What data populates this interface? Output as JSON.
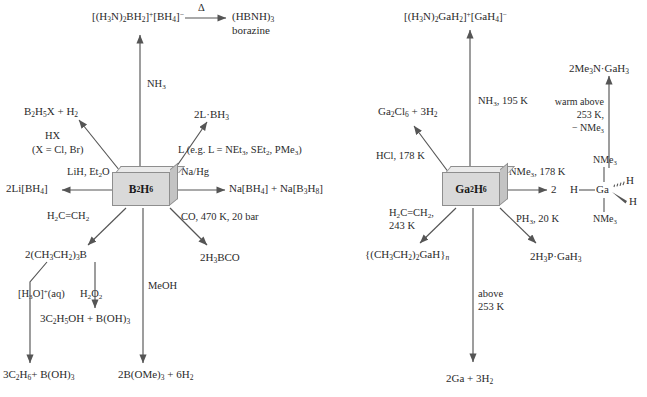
{
  "diagram": {
    "left_scheme": {
      "center": "B2H6",
      "center_html": "B<sub>2</sub>H<sub>6</sub>",
      "products": {
        "ammonia_adduct": "[(H3N)2BH2]+[BH4]-",
        "borazine": "(HBNH)3",
        "borazine_name": "borazine",
        "halodiborane": "B2H5X + H2",
        "lewis_adduct": "2L·BH3",
        "lithium_borohydride": "2Li[BH4]",
        "sodium_salts": "Na[BH4] + Na[B3H8]",
        "triethylborane": "2(CH3CH2)3B",
        "borane_carbonyl": "2H3BCO",
        "ethanol_boric": "3C2H5OH + B(OH)3",
        "ethane_boric": "3C2H6 + B(OH)3",
        "trimethylborate": "2B(OMe)3 + 6H2"
      },
      "conditions": {
        "ammonia": "NH3",
        "heat": "Δ",
        "hydrogen_halide": "HX",
        "halide_note": "(X = Cl, Br)",
        "lewis_base": "L (e.g. L = NEt3, SEt2, PMe3)",
        "lithium_hydride": "LiH, Et2O",
        "sodium_amalgam": "Na/Hg",
        "ethene": "H2C=CH2",
        "carbon_monoxide": "CO, 470 K, 20 bar",
        "methanol": "MeOH",
        "hydronium": "[H3O]+(aq)",
        "hydrogen_peroxide": "H2O2"
      }
    },
    "right_scheme": {
      "center": "Ga2H6",
      "center_html": "Ga<sub>2</sub>H<sub>6</sub>",
      "products": {
        "ammonia_adduct": "[(H3N)2GaH2]+[GaH4]-",
        "gallium_chloride": "Ga2Cl6 + 3H2",
        "trimethylamine_gallane": "2Me3N·GaH3",
        "bis_adduct_prefix": "2",
        "diethylgallium_hydride": "{(CH3CH2)2GaH}n",
        "phosphine_adduct": "2H3P·GaH3",
        "decomposition": "2Ga + 3H2"
      },
      "conditions": {
        "ammonia": "NH3, 195 K",
        "hydrogen_chloride": "HCl, 178 K",
        "trimethylamine": "NMe3, 178 K",
        "warm_line1": "warm above",
        "warm_line2": "253 K,",
        "warm_line3": "− NMe3",
        "ethene_line1": "H2C=CH2,",
        "ethene_line2": "243 K",
        "phosphine": "PH3, 20 K",
        "above_line1": "above",
        "above_line2": "253 K"
      },
      "structure": {
        "metal": "Ga",
        "ligand_top": "NMe3",
        "ligand_bottom": "NMe3",
        "hydride_left": "H",
        "hydride_hashed": "H",
        "hydride_wedge": "H"
      }
    },
    "colors": {
      "box_face": "#d9d9d9",
      "box_top": "#eaeaea",
      "box_side": "#c3c3c3",
      "line": "#555555",
      "text": "#2b2b2b"
    }
  }
}
